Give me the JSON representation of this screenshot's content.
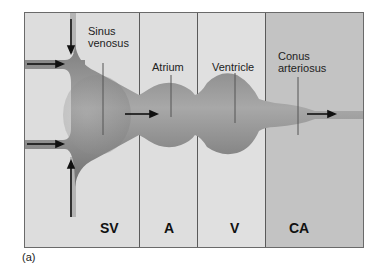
{
  "figure": {
    "caption": "(a)",
    "colors": {
      "background": "#dcdcdc",
      "conus_region": "#c3c3c3",
      "tube": "#8e8e8e",
      "border": "#6a6a6a"
    }
  },
  "labels": {
    "sinus_venosus_line1": "Sinus",
    "sinus_venosus_line2": "venosus",
    "atrium": "Atrium",
    "ventricle": "Ventricle",
    "conus_line1": "Conus",
    "conus_line2": "arteriosus"
  },
  "regions": [
    {
      "abbr": "SV",
      "name": "Sinus venosus"
    },
    {
      "abbr": "A",
      "name": "Atrium"
    },
    {
      "abbr": "V",
      "name": "Ventricle"
    },
    {
      "abbr": "CA",
      "name": "Conus arteriosus"
    }
  ]
}
